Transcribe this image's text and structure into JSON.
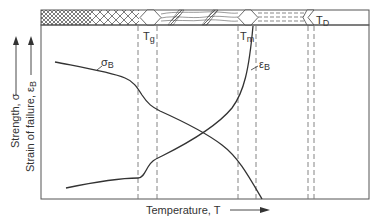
{
  "diagram": {
    "xlabel": "Temperature, T",
    "ylabel_strength": "Strength, σ",
    "ylabel_strain": "Strain of failure, ε",
    "ylabel_strain_sub": "B",
    "transitions": [
      {
        "name": "T",
        "sub": "g"
      },
      {
        "name": "T",
        "sub": "m"
      },
      {
        "name": "T",
        "sub": "D"
      }
    ],
    "curves": [
      {
        "name": "σ",
        "sub": "B",
        "meaning": "strength"
      },
      {
        "name": "ε",
        "sub": "B",
        "meaning": "strain of failure"
      }
    ],
    "state_bar_regions": [
      "glassy",
      "rubbery/leathery",
      "melt",
      "decomposition"
    ],
    "line_color": "#333333",
    "dash_color": "#777777"
  }
}
